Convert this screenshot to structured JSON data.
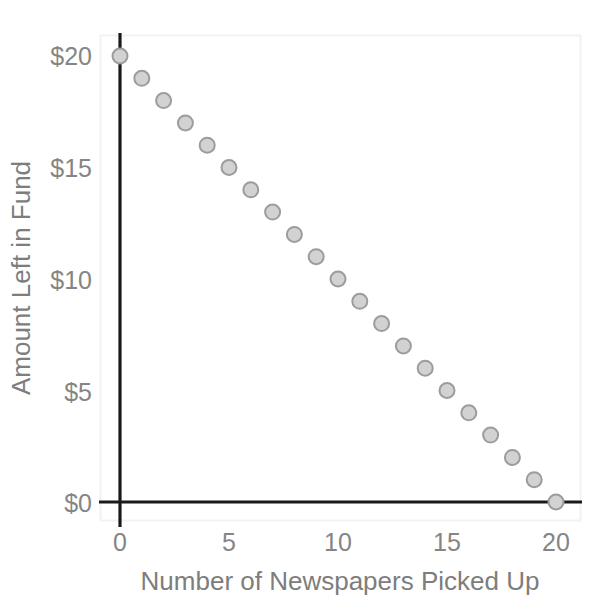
{
  "chart_data": {
    "type": "scatter",
    "title": "",
    "xlabel": "Number of Newspapers Picked Up",
    "ylabel": "Amount Left in Fund",
    "x": [
      0,
      1,
      2,
      3,
      4,
      5,
      6,
      7,
      8,
      9,
      10,
      11,
      12,
      13,
      14,
      15,
      16,
      17,
      18,
      19,
      20
    ],
    "values": [
      20,
      19,
      18,
      17,
      16,
      15,
      14,
      13,
      12,
      11,
      10,
      9,
      8,
      7,
      6,
      5,
      4,
      3,
      2,
      1,
      0
    ],
    "series": [
      {
        "name": "Amount Left in Fund",
        "values": [
          20,
          19,
          18,
          17,
          16,
          15,
          14,
          13,
          12,
          11,
          10,
          9,
          8,
          7,
          6,
          5,
          4,
          3,
          2,
          1,
          0
        ]
      }
    ],
    "xlim": [
      0,
      20
    ],
    "ylim": [
      0,
      20
    ],
    "xticks": [
      0,
      5,
      10,
      15,
      20
    ],
    "yticks": [
      0,
      5,
      10,
      15,
      20
    ],
    "xtick_labels": [
      "0",
      "5",
      "10",
      "15",
      "20"
    ],
    "ytick_labels": [
      "$0",
      "$5",
      "$10",
      "$15",
      "$20"
    ],
    "grid": false,
    "legend": null,
    "marker": {
      "shape": "circle",
      "fill_color": "#d2d2d2",
      "edge_color": "#9c9c9c",
      "size_px": 15
    },
    "colors": {
      "axis": "#1a1a1a",
      "tick_label": "#858585",
      "axis_title": "#7d7d7d",
      "plot_frame": "#f2f2f2",
      "background": "#ffffff"
    }
  },
  "axes": {
    "x_title": "Number of Newspapers Picked Up",
    "y_title": "Amount Left in Fund",
    "x_tick_labels": [
      "0",
      "5",
      "10",
      "15",
      "20"
    ],
    "y_tick_labels": [
      "$0",
      "$5",
      "$10",
      "$15",
      "$20"
    ]
  }
}
